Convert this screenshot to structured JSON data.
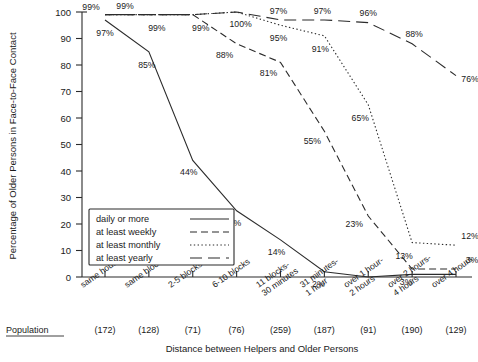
{
  "chart_data": {
    "type": "line",
    "title": "",
    "xlabel": "Distance between Helpers and Older Persons",
    "ylabel": "Percentage of Older Persons in Face-to-Face Contact",
    "ylim": [
      0,
      100
    ],
    "yticks": [
      0,
      10,
      20,
      30,
      40,
      50,
      60,
      70,
      80,
      90,
      100
    ],
    "grid": false,
    "legend_position": "lower-left-inside",
    "categories": [
      "same household",
      "same block",
      "2-5 blocks",
      "6-10 blocks",
      "11 blocks-\n30 minutes",
      "31 minutes-\n1 hour",
      "over 1 hour-\n2 hours",
      "over 2 hours-\n4 hours",
      "over 4 hours"
    ],
    "population_label": "Population",
    "population": [
      "(172)",
      "(128)",
      "(71)",
      "(76)",
      "(259)",
      "(187)",
      "(91)",
      "(190)",
      "(129)"
    ],
    "series": [
      {
        "name": "daily or more",
        "style": "solid",
        "values": [
          97,
          85,
          44,
          25,
          14,
          2,
          0,
          1,
          1
        ],
        "point_labels": [
          "97%",
          "85%",
          "44%",
          "25%",
          "14%",
          "2%",
          "",
          "",
          ""
        ]
      },
      {
        "name": "at least weekly",
        "style": "dashed",
        "values": [
          99,
          99,
          99,
          88,
          81,
          55,
          23,
          3,
          3
        ],
        "point_labels": [
          "99%",
          "99%",
          "99%",
          "88%",
          "81%",
          "55%",
          "23%",
          "3%",
          "3%"
        ]
      },
      {
        "name": "at least monthly",
        "style": "dotted",
        "values": [
          99,
          99,
          99,
          100,
          95,
          91,
          65,
          13,
          12
        ],
        "point_labels": [
          "",
          "",
          "",
          "100%",
          "95%",
          "91%",
          "65%",
          "13%",
          "12%"
        ]
      },
      {
        "name": "at least yearly",
        "style": "longdash",
        "values": [
          99,
          99,
          99,
          100,
          97,
          97,
          96,
          88,
          76
        ],
        "point_labels": [
          "99%",
          "",
          "",
          "",
          "97%",
          "97%",
          "96%",
          "88%",
          "76%"
        ]
      }
    ],
    "legend_entries": [
      "daily or more",
      "at least weekly",
      "at least monthly",
      "at least yearly"
    ],
    "ink_color": "#2b2b2b"
  }
}
